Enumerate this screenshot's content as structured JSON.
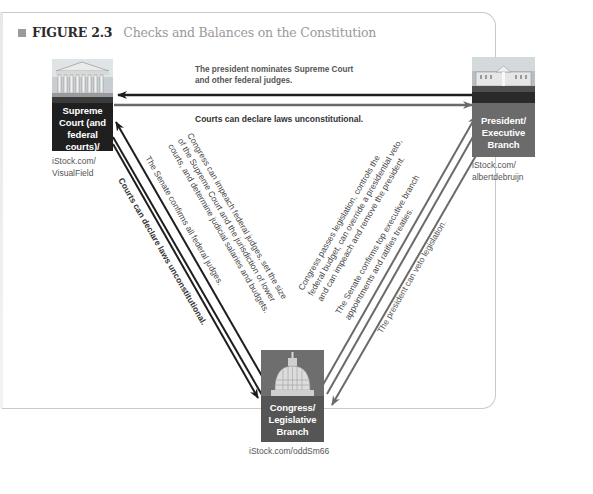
{
  "figure": {
    "label": "FIGURE 2.3",
    "title": "Checks and Balances on the Constitution"
  },
  "branches": {
    "judicial": {
      "label_lines": [
        "Supreme",
        "Court (and",
        "federal courts)/",
        "Judicial Branch"
      ],
      "credit": "iStock.com/\nVisualField",
      "color": "#1f1f1f"
    },
    "executive": {
      "label_lines": [
        "President/",
        "Executive",
        "Branch"
      ],
      "credit": "iStock.com/\nalbertdebruijn",
      "color": "#6b6b6b"
    },
    "legislative": {
      "label_lines": [
        "Congress/",
        "Legislative",
        "Branch"
      ],
      "credit": "iStock.com/oddSm66",
      "color": "#555555"
    }
  },
  "arrows": {
    "executive_to_judicial": [
      "The president nominates Supreme Court",
      "and other federal judges."
    ],
    "judicial_to_executive": "Courts can declare laws unconstitutional.",
    "judicial_to_legislative": "Courts can declare laws unconstitutional.",
    "legislative_to_judicial": [
      "Congress can impeach federal judges, set the size",
      "of the Supreme Court and the jurisdiction of lower",
      "courts, and determine judicial salaries and budgets."
    ],
    "senate_to_judicial": "The Senate confirms all federal judges.",
    "legislative_to_executive": [
      "Congress passes legislation, controls the",
      "federal budget, can override a presidential veto,",
      "and can impeach and remove the president."
    ],
    "senate_to_executive": [
      "The Senate confirms top executive branch",
      "appointments and ratifies treaties."
    ],
    "executive_to_legislative": "The president can veto legislation."
  },
  "colors": {
    "dark_arrow": "#1e1e1e",
    "gray_arrow": "#6a6a6a",
    "frame": "#c9c9c9",
    "figure_label": "#2a2a2a",
    "figure_title": "#9a9a9a"
  }
}
